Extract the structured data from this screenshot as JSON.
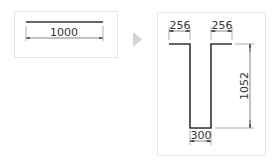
{
  "before": {
    "bar_length_label": "1000"
  },
  "transition": {
    "icon": "play-triangle-icon",
    "color": "#d4d4d4"
  },
  "after": {
    "left_flange_label": "256",
    "right_flange_label": "256",
    "depth_label": "1052",
    "bottom_width_label": "300"
  },
  "colors": {
    "line": "#333333",
    "border": "#e6e6e6",
    "dim": "#555555"
  }
}
